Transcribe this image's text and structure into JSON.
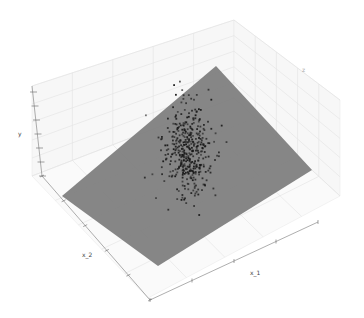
{
  "chart_data": {
    "type": "scatter",
    "subtype": "3d-scatter-with-regression-plane",
    "title": "",
    "xlabel": "x_1",
    "ylabel": "x_2",
    "zlabel": "y",
    "extra_label": "z",
    "grid": true,
    "legend": null,
    "plane": {
      "color": "#808080",
      "corners_px": [
        [
          216,
          66
        ],
        [
          312,
          170
        ],
        [
          158,
          266
        ],
        [
          62,
          196
        ]
      ]
    },
    "points": {
      "color": "#1a1a1a",
      "count_approx": 400,
      "center_px": [
        186,
        150
      ],
      "spread_px": [
        22,
        42
      ]
    }
  },
  "labels": {
    "x1": "x_1",
    "x2": "x_2",
    "y": "y",
    "z": "z"
  }
}
